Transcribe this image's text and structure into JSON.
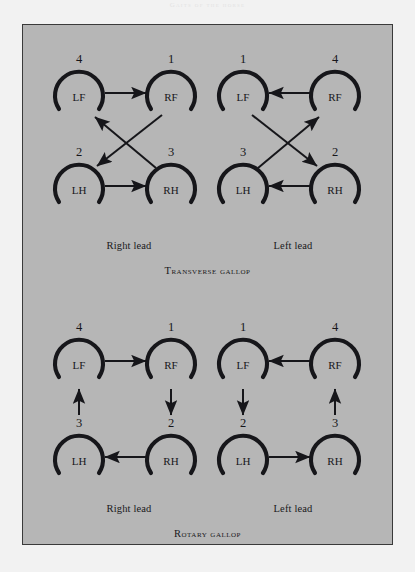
{
  "page": {
    "bleed_text": "Gaits of the horse",
    "background_color": "#f2f2f2",
    "panel_color": "#b6b6b6",
    "ink_color": "#16161a"
  },
  "figure": {
    "sections": [
      {
        "id": "transverse",
        "title": "Transverse gallop",
        "panels": [
          {
            "id": "transverse-right-lead",
            "lead_label": "Right lead",
            "hooves": [
              {
                "id": "LF",
                "label": "LF",
                "seq": "4",
                "pos": "top-left"
              },
              {
                "id": "RF",
                "label": "RF",
                "seq": "1",
                "pos": "top-right"
              },
              {
                "id": "LH",
                "label": "LH",
                "seq": "2",
                "pos": "bottom-left"
              },
              {
                "id": "RH",
                "label": "RH",
                "seq": "3",
                "pos": "bottom-right"
              }
            ],
            "arrows": [
              {
                "from": "LF",
                "to": "RF",
                "kind": "horizontal"
              },
              {
                "from": "LH",
                "to": "RH",
                "kind": "horizontal"
              },
              {
                "from": "RF",
                "to": "LH",
                "kind": "diagonal"
              },
              {
                "from": "RH",
                "to": "LF",
                "kind": "diagonal"
              }
            ]
          },
          {
            "id": "transverse-left-lead",
            "lead_label": "Left lead",
            "hooves": [
              {
                "id": "LF",
                "label": "LF",
                "seq": "1",
                "pos": "top-left"
              },
              {
                "id": "RF",
                "label": "RF",
                "seq": "4",
                "pos": "top-right"
              },
              {
                "id": "LH",
                "label": "LH",
                "seq": "3",
                "pos": "bottom-left"
              },
              {
                "id": "RH",
                "label": "RH",
                "seq": "2",
                "pos": "bottom-right"
              }
            ],
            "arrows": [
              {
                "from": "RF",
                "to": "LF",
                "kind": "horizontal"
              },
              {
                "from": "RH",
                "to": "LH",
                "kind": "horizontal"
              },
              {
                "from": "LF",
                "to": "RH",
                "kind": "diagonal"
              },
              {
                "from": "LH",
                "to": "RF",
                "kind": "diagonal"
              }
            ]
          }
        ]
      },
      {
        "id": "rotary",
        "title": "Rotary gallop",
        "panels": [
          {
            "id": "rotary-right-lead",
            "lead_label": "Right lead",
            "hooves": [
              {
                "id": "LF",
                "label": "LF",
                "seq": "4",
                "pos": "top-left"
              },
              {
                "id": "RF",
                "label": "RF",
                "seq": "1",
                "pos": "top-right"
              },
              {
                "id": "LH",
                "label": "LH",
                "seq": "3",
                "pos": "bottom-left"
              },
              {
                "id": "RH",
                "label": "RH",
                "seq": "2",
                "pos": "bottom-right"
              }
            ],
            "arrows": [
              {
                "from": "LF",
                "to": "RF",
                "kind": "horizontal"
              },
              {
                "from": "RF",
                "to": "RH",
                "kind": "vertical"
              },
              {
                "from": "RH",
                "to": "LH",
                "kind": "horizontal"
              },
              {
                "from": "LH",
                "to": "LF",
                "kind": "vertical"
              }
            ]
          },
          {
            "id": "rotary-left-lead",
            "lead_label": "Left lead",
            "hooves": [
              {
                "id": "LF",
                "label": "LF",
                "seq": "1",
                "pos": "top-left"
              },
              {
                "id": "RF",
                "label": "RF",
                "seq": "4",
                "pos": "top-right"
              },
              {
                "id": "LH",
                "label": "LH",
                "seq": "2",
                "pos": "bottom-left"
              },
              {
                "id": "RH",
                "label": "RH",
                "seq": "3",
                "pos": "bottom-right"
              }
            ],
            "arrows": [
              {
                "from": "RF",
                "to": "LF",
                "kind": "horizontal"
              },
              {
                "from": "LF",
                "to": "LH",
                "kind": "vertical"
              },
              {
                "from": "LH",
                "to": "RH",
                "kind": "horizontal"
              },
              {
                "from": "RH",
                "to": "RF",
                "kind": "vertical"
              }
            ]
          }
        ]
      }
    ]
  }
}
